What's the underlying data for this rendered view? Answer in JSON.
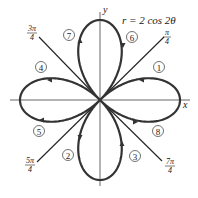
{
  "figure": {
    "equation": "r = 2 cos 2θ",
    "axes": {
      "x_label": "x",
      "y_label": "y"
    },
    "curve": {
      "type": "four-leaved rose",
      "a": 2,
      "n": 2,
      "color": "#333333"
    },
    "angle_rays": [
      {
        "label_num": "π",
        "label_den": "4",
        "angle": "π/4"
      },
      {
        "label_num": "3π",
        "label_den": "4",
        "angle": "3π/4"
      },
      {
        "label_num": "5π",
        "label_den": "4",
        "angle": "5π/4"
      },
      {
        "label_num": "7π",
        "label_den": "4",
        "angle": "7π/4"
      }
    ],
    "order_markers": [
      "1",
      "2",
      "3",
      "4",
      "5",
      "6",
      "7",
      "8"
    ]
  }
}
